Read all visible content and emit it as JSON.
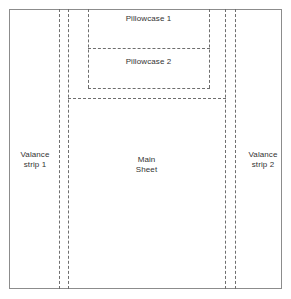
{
  "diagram": {
    "type": "fabric-cutting-layout",
    "canvas": {
      "width": 291,
      "height": 299
    },
    "colors": {
      "background": "#ffffff",
      "frame_stroke": "#8c8c8c",
      "cut_line_stroke": "#6e6e6e",
      "label_text": "#333333"
    },
    "frame": {
      "name": "fabric-outer-edge",
      "x": 9,
      "y": 9,
      "width": 273,
      "height": 280,
      "stroke_style": "solid"
    },
    "labels": {
      "pillowcase_1": "Pillowcase 1",
      "pillowcase_2": "Pillowcase 2",
      "main_sheet": "Main\nSheet",
      "valance_strip_1": "Valance\nstrip 1",
      "valance_strip_2": "Valance\nstrip 2"
    },
    "regions": [
      {
        "name": "pillowcase-1",
        "label": "Pillowcase 1",
        "x": 88,
        "y": 9,
        "width": 121,
        "height": 39,
        "stroke_style": "dashed"
      },
      {
        "name": "pillowcase-2",
        "label": "Pillowcase 2",
        "x": 88,
        "y": 48,
        "width": 121,
        "height": 40,
        "stroke_style": "dashed"
      },
      {
        "name": "main-sheet",
        "label": "Main Sheet",
        "x": 68,
        "y": 98,
        "width": 157,
        "height": 191,
        "stroke_style": "dashed"
      },
      {
        "name": "valance-strip-1",
        "label": "Valance strip 1",
        "x": 59,
        "y": 9,
        "width": 9,
        "height": 280,
        "stroke_style": "dashed"
      },
      {
        "name": "valance-strip-2",
        "label": "Valance strip 2",
        "x": 225,
        "y": 9,
        "width": 10,
        "height": 280,
        "stroke_style": "dashed"
      }
    ],
    "cut_lines": {
      "vertical": [
        {
          "name": "valance-1-outer-cut",
          "x": 59,
          "y_start": 9,
          "y_end": 289
        },
        {
          "name": "valance-1-inner-cut",
          "x": 68,
          "y_start": 9,
          "y_end": 289
        },
        {
          "name": "valance-2-inner-cut",
          "x": 225,
          "y_start": 9,
          "y_end": 289
        },
        {
          "name": "valance-2-outer-cut",
          "x": 235,
          "y_start": 9,
          "y_end": 289
        },
        {
          "name": "pillowcase-left-cut",
          "x": 88,
          "y_start": 9,
          "y_end": 88
        },
        {
          "name": "pillowcase-right-cut",
          "x": 209,
          "y_start": 9,
          "y_end": 88
        }
      ],
      "horizontal": [
        {
          "name": "pillowcase-divider-cut",
          "y": 48,
          "x_start": 88,
          "x_end": 209
        },
        {
          "name": "pillowcase-bottom-cut",
          "y": 88,
          "x_start": 88,
          "x_end": 209
        },
        {
          "name": "main-sheet-top-cut",
          "y": 98,
          "x_start": 68,
          "x_end": 225
        }
      ]
    }
  }
}
